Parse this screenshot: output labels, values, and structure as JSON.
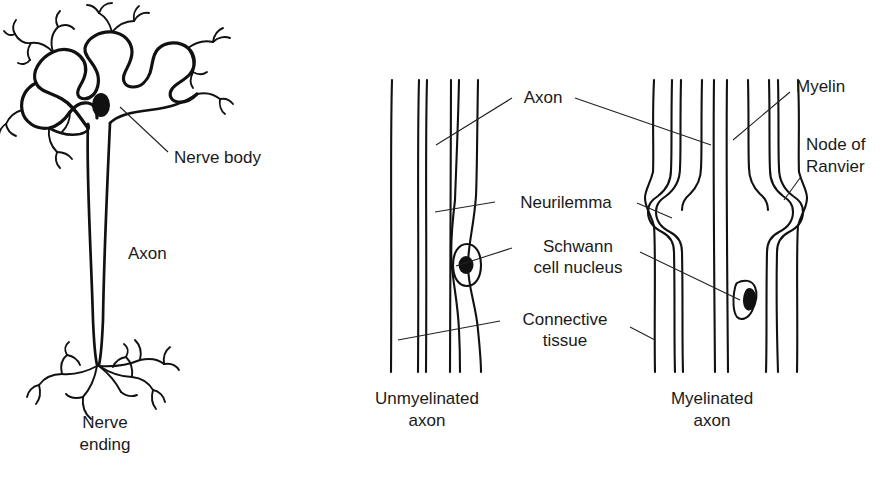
{
  "figure": {
    "background_color": "#ffffff",
    "ink_color": "#111111"
  },
  "left_panel": {
    "name": "neuron-cell-diagram",
    "labels": {
      "nerve_body": "Nerve body",
      "axon": "Axon",
      "nerve_ending_line1": "Nerve",
      "nerve_ending_line2": "ending"
    },
    "parts": [
      "dendrites",
      "soma",
      "nucleus",
      "axon-shaft",
      "terminal-branches"
    ]
  },
  "right_panel": {
    "name": "axon-comparison-diagram",
    "labels": {
      "axon": "Axon",
      "neurilemma": "Neurilemma",
      "schwann_line1": "Schwann",
      "schwann_line2": "cell nucleus",
      "connective_line1": "Connective",
      "connective_line2": "tissue",
      "myelin": "Myelin",
      "node_line1": "Node of",
      "node_line2": "Ranvier"
    },
    "captions": {
      "unmyelinated_line1": "Unmyelinated",
      "unmyelinated_line2": "axon",
      "myelinated_line1": "Myelinated",
      "myelinated_line2": "axon"
    }
  }
}
